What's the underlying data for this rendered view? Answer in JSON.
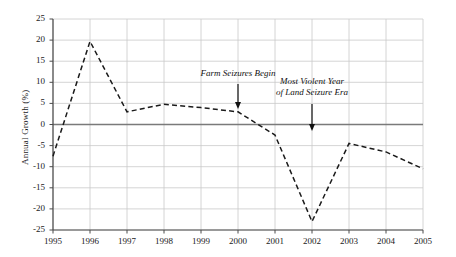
{
  "chart_data": {
    "type": "line",
    "title": "",
    "xlabel": "",
    "ylabel": "Annual Growth (%)",
    "x": [
      1995,
      1996,
      1997,
      1998,
      1999,
      2000,
      2001,
      2002,
      2003,
      2004,
      2005
    ],
    "categories": [
      "1995",
      "1996",
      "1997",
      "1998",
      "1999",
      "2000",
      "2001",
      "2002",
      "2003",
      "2004",
      "2005"
    ],
    "values": [
      -7.5,
      19.7,
      3.0,
      4.8,
      4.0,
      3.0,
      -2.5,
      -23.0,
      -4.5,
      -6.5,
      -10.5
    ],
    "series": [
      {
        "name": "Annual Growth (%)",
        "values": [
          -7.5,
          19.7,
          3.0,
          4.8,
          4.0,
          3.0,
          -2.5,
          -23.0,
          -4.5,
          -6.5,
          -10.5
        ],
        "style": "dashed",
        "color": "#1a1a1a"
      }
    ],
    "xlim": [
      1995,
      2005
    ],
    "ylim": [
      -25,
      25
    ],
    "ytick_values": [
      25,
      20,
      15,
      10,
      5,
      0,
      -5,
      -10,
      -15,
      -20,
      -25
    ],
    "ytick_labels": [
      "25",
      "20",
      "15",
      "10",
      "5",
      "0",
      "-5",
      "-10",
      "-15",
      "-20",
      "-25"
    ],
    "xtick_labels": [
      "1995",
      "1996",
      "1997",
      "1998",
      "1999",
      "2000",
      "2001",
      "2002",
      "2003",
      "2004",
      "2005"
    ],
    "grid": true,
    "grid_color": "#c9c9c9",
    "zero_line": true,
    "zero_line_color": "#7a7a7a",
    "legend": false,
    "annotations": [
      {
        "id": "farm-seizures",
        "text": "Farm Seizures Begin",
        "lines": [
          "Farm Seizures Begin"
        ],
        "points_to_x": 2000,
        "arrow": "down"
      },
      {
        "id": "most-violent-year",
        "text": "Most Violent Year of Land Seizure Era",
        "lines": [
          "Most Violent Year",
          "of Land Seizure Era"
        ],
        "points_to_x": 2002,
        "arrow": "down"
      }
    ]
  }
}
